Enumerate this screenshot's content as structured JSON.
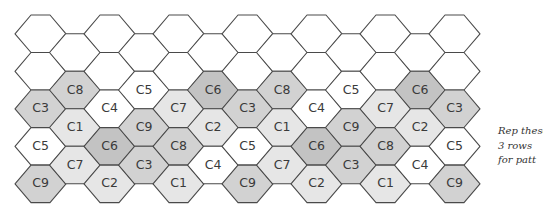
{
  "diagram": {
    "type": "hexagon-chart",
    "shades": {
      "white": "#ffffff",
      "light": "#e6e6e6",
      "medium": "#d2d2d2",
      "dark": "#c3c3c3"
    },
    "label_shades": {
      "C1": "light",
      "C2": "light",
      "C3": "medium",
      "C4": "white",
      "C5": "white",
      "C6": "dark",
      "C7": "light",
      "C8": "medium",
      "C9": "medium"
    },
    "columns": [
      {
        "col": 0,
        "cells": [
          "",
          "",
          "C3",
          "C5",
          "C9"
        ]
      },
      {
        "col": 1,
        "cells": [
          "",
          "C8",
          "C1",
          "C7"
        ]
      },
      {
        "col": 2,
        "cells": [
          "",
          "",
          "C4",
          "C6",
          "C2"
        ]
      },
      {
        "col": 3,
        "cells": [
          "",
          "C5",
          "C9",
          "C3"
        ]
      },
      {
        "col": 4,
        "cells": [
          "",
          "",
          "C7",
          "C8",
          "C1"
        ]
      },
      {
        "col": 5,
        "cells": [
          "",
          "C6",
          "C2",
          "C4"
        ]
      },
      {
        "col": 6,
        "cells": [
          "",
          "",
          "C3",
          "C5",
          "C9"
        ]
      },
      {
        "col": 7,
        "cells": [
          "",
          "C8",
          "C1",
          "C7"
        ]
      },
      {
        "col": 8,
        "cells": [
          "",
          "",
          "C4",
          "C6",
          "C2"
        ]
      },
      {
        "col": 9,
        "cells": [
          "",
          "C5",
          "C9",
          "C3"
        ]
      },
      {
        "col": 10,
        "cells": [
          "",
          "",
          "C7",
          "C8",
          "C1"
        ]
      },
      {
        "col": 11,
        "cells": [
          "",
          "C6",
          "C2",
          "C4"
        ]
      },
      {
        "col": 12,
        "cells": [
          "",
          "",
          "C3",
          "C5",
          "C9"
        ]
      }
    ]
  },
  "note": {
    "line1": "Rep these",
    "line2": "3 rows",
    "line3": "for patt"
  }
}
